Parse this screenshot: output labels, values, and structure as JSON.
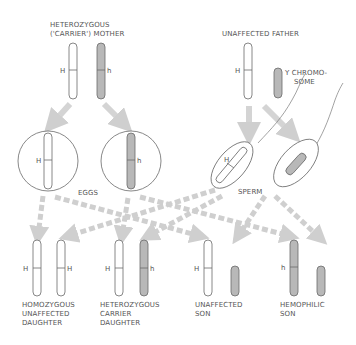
{
  "colors": {
    "chromosome_normal_fill": "#ffffff",
    "chromosome_affected_fill": "#b8b8b8",
    "outline": "#6a6a6a",
    "arrow": "#cfcfcf",
    "text": "#555555"
  },
  "parents": {
    "mother": {
      "label_line1": "HETEROZYGOUS",
      "label_line2": "('CARRIER') MOTHER",
      "allele_left": "H",
      "allele_right": "h"
    },
    "father": {
      "label": "UNAFFECTED FATHER",
      "allele_x": "H",
      "y_label_line1": "Y CHROMO-",
      "y_label_line2": "SOME"
    }
  },
  "gametes": {
    "eggs_label": "EGGS",
    "sperm_label": "SPERM",
    "egg_alleles": [
      "H",
      "h"
    ],
    "sperm_allele": "H"
  },
  "offspring": [
    {
      "line1": "HOMOZYGOUS",
      "line2": "UNAFFECTED",
      "line3": "DAUGHTER",
      "alleles": [
        "H",
        "H"
      ]
    },
    {
      "line1": "HETEROZYGOUS",
      "line2": "CARRIER",
      "line3": "DAUGHTER",
      "alleles": [
        "H",
        "h"
      ]
    },
    {
      "line1": "UNAFFECTED",
      "line2": "SON",
      "line3": "",
      "alleles": [
        "H"
      ]
    },
    {
      "line1": "HEMOPHILIC",
      "line2": "SON",
      "line3": "",
      "alleles": [
        "h"
      ]
    }
  ]
}
